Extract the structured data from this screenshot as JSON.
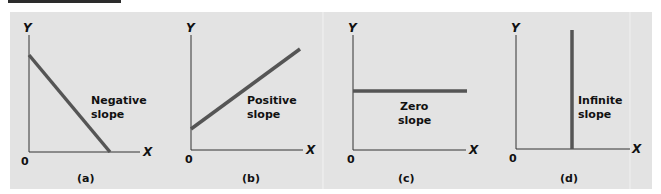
{
  "colors": {
    "background": "#e3e3e3",
    "axis": "#333333",
    "line": "#555555",
    "text": "#111111",
    "banner": "#2c2c2c"
  },
  "panels": [
    {
      "id": "a",
      "caption": "(a)",
      "y_label": "Y",
      "x_label": "X",
      "origin_label": "0",
      "annotation": [
        "Negative",
        "slope"
      ],
      "slope_type": "negative"
    },
    {
      "id": "b",
      "caption": "(b)",
      "y_label": "Y",
      "x_label": "X",
      "origin_label": "0",
      "annotation": [
        "Positive",
        "slope"
      ],
      "slope_type": "positive"
    },
    {
      "id": "c",
      "caption": "(c)",
      "y_label": "Y",
      "x_label": "X",
      "origin_label": "0",
      "annotation": [
        "Zero",
        "slope"
      ],
      "slope_type": "zero"
    },
    {
      "id": "d",
      "caption": "(d)",
      "y_label": "Y",
      "x_label": "X",
      "origin_label": "0",
      "annotation": [
        "Infinite",
        "slope"
      ],
      "slope_type": "infinite"
    }
  ]
}
